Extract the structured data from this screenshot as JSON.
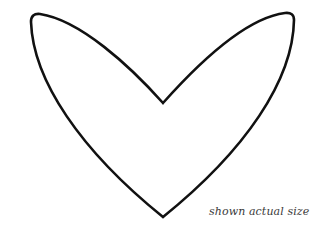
{
  "figure": {
    "caption": "shown actual size",
    "shape": "heart-outline",
    "stroke_color": "#111111",
    "background_color": "#ffffff"
  }
}
